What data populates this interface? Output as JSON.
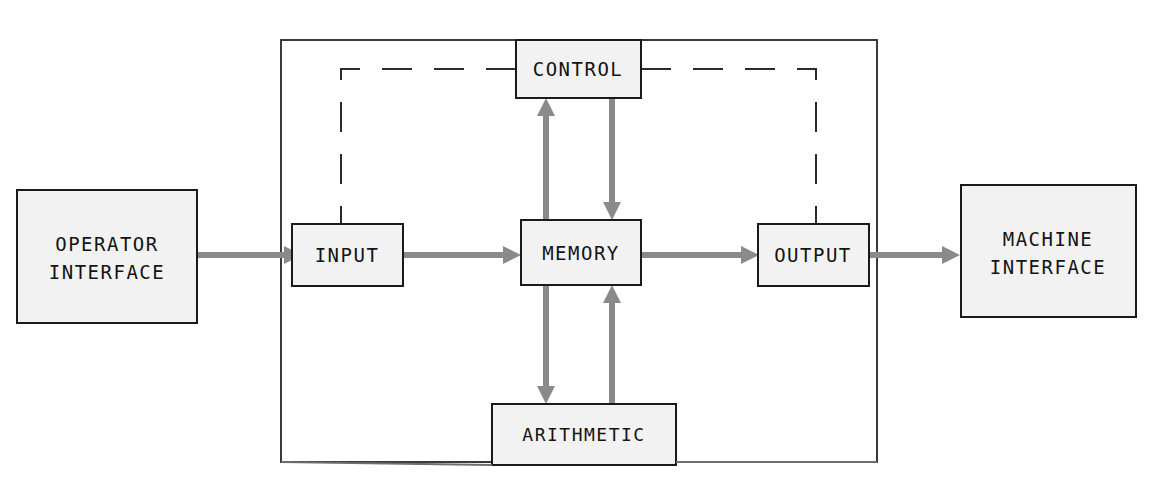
{
  "diagram": {
    "background_color": "#ffffff",
    "box_fill": "#f2f2f2",
    "box_stroke": "#1a1a1a",
    "flow_color": "#8a8a8a",
    "control_color": "#2b2b2b",
    "outer_stroke": "#3a3a3a"
  },
  "boxes": {
    "operator_interface": {
      "line1": "OPERATOR",
      "line2": "INTERFACE"
    },
    "machine_interface": {
      "line1": "MACHINE",
      "line2": "INTERFACE"
    },
    "input": {
      "label": "INPUT"
    },
    "output": {
      "label": "OUTPUT"
    },
    "control": {
      "label": "CONTROL"
    },
    "memory": {
      "label": "MEMORY"
    },
    "arithmetic": {
      "label": "ARITHMETIC"
    }
  },
  "connections": {
    "operator_to_input": "data flow",
    "input_to_memory": "data flow",
    "memory_to_output": "data flow",
    "output_to_machine": "data flow",
    "memory_to_control": "data flow up",
    "control_to_memory": "data flow down",
    "memory_to_arithmetic": "data flow down",
    "arithmetic_to_memory": "data flow up",
    "control_to_input": "control signal",
    "control_to_output": "control signal"
  }
}
